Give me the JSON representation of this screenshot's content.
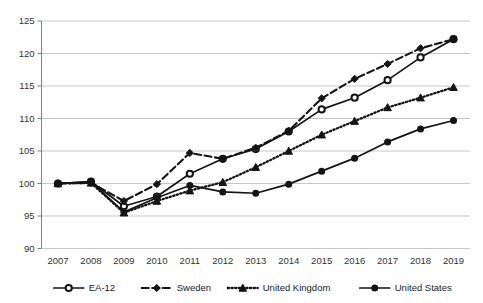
{
  "chart_data": {
    "type": "line",
    "title": "",
    "subtitle": "",
    "xlabel": "",
    "ylabel": "",
    "categories": [
      "2007",
      "2008",
      "2009",
      "2010",
      "2011",
      "2012",
      "2013",
      "2014",
      "2015",
      "2016",
      "2017",
      "2018",
      "2019"
    ],
    "x": [
      2007,
      2008,
      2009,
      2010,
      2011,
      2012,
      2013,
      2014,
      2015,
      2016,
      2017,
      2018,
      2019
    ],
    "ylim": [
      90,
      125
    ],
    "yticks": [
      90,
      95,
      100,
      105,
      110,
      115,
      120,
      125
    ],
    "grid": true,
    "legend_position": "bottom",
    "series": [
      {
        "name": "EA-12",
        "marker": "circle-open",
        "line_style": "solid",
        "color": "#141414",
        "values": [
          100.0,
          100.3,
          96.5,
          98.0,
          101.5,
          103.8,
          105.3,
          108.0,
          111.4,
          113.2,
          115.9,
          119.4,
          122.2
        ]
      },
      {
        "name": "Sweden",
        "marker": "diamond",
        "line_style": "dashed",
        "color": "#141414",
        "values": [
          100.0,
          100.1,
          97.3,
          99.9,
          104.7,
          103.8,
          105.5,
          108.1,
          113.1,
          116.1,
          118.4,
          120.8,
          122.2
        ]
      },
      {
        "name": "United Kingdom",
        "marker": "triangle",
        "line_style": "dotted",
        "color": "#141414",
        "values": [
          100.0,
          100.1,
          95.5,
          97.3,
          98.9,
          100.2,
          102.5,
          105.0,
          107.5,
          109.6,
          111.7,
          113.2,
          114.8
        ]
      },
      {
        "name": "United States",
        "marker": "circle-filled",
        "line_style": "solid",
        "color": "#141414",
        "values": [
          100.0,
          100.3,
          95.6,
          97.8,
          99.7,
          98.7,
          98.5,
          99.9,
          101.9,
          103.9,
          106.4,
          108.4,
          109.7
        ]
      }
    ]
  },
  "legend": {
    "items": [
      {
        "label": "EA-12"
      },
      {
        "label": "Sweden"
      },
      {
        "label": "United Kingdom"
      },
      {
        "label": "United States"
      }
    ]
  }
}
